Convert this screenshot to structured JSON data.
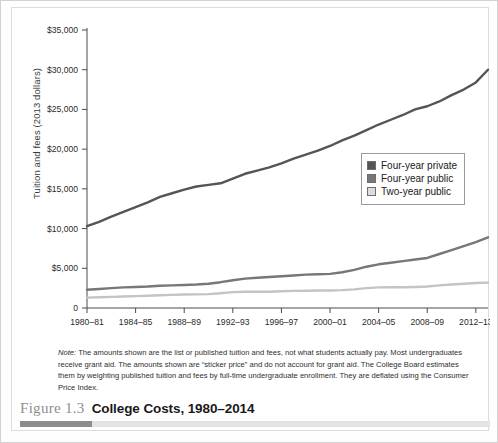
{
  "figure": {
    "number": "Figure 1.3",
    "title": "College Costs, 1980–2014"
  },
  "axes": {
    "ylabel": "Tuition and fees (2013 dollars)",
    "yticks": [
      "0",
      "$5,000",
      "$10,000",
      "$15,000",
      "$20,000",
      "$25,000",
      "$30,000",
      "$35,000"
    ],
    "xticks": [
      "1980–81",
      "1984–85",
      "1988–89",
      "1992–93",
      "1996–97",
      "2000–01",
      "2004–05",
      "2008–09",
      "2012–13"
    ]
  },
  "legend": {
    "items": [
      {
        "label": "Four-year private",
        "color": "#555555"
      },
      {
        "label": "Four-year public",
        "color": "#777777"
      },
      {
        "label": "Two-year public",
        "color": "#c4c4c4"
      }
    ]
  },
  "note": {
    "prefix": "Note:",
    "text": " The amounts shown are the list or published tuition and fees, not what students actually pay. Most undergraduates receive grant aid. The amounts shown are “sticker price” and do not account for grant aid. The College Board estimates them by weighting published tuition and fees by full-time undergraduate enrollment. They are deflated using the Consumer Price Index."
  },
  "chart_data": {
    "type": "line",
    "title": "College Costs, 1980–2014",
    "xlabel": "",
    "ylabel": "Tuition and fees (2013 dollars)",
    "ylim": [
      0,
      35000
    ],
    "grid": false,
    "legend_position": "right-middle",
    "x": [
      "1980–81",
      "1981–82",
      "1982–83",
      "1983–84",
      "1984–85",
      "1985–86",
      "1986–87",
      "1987–88",
      "1988–89",
      "1989–90",
      "1990–91",
      "1991–92",
      "1992–93",
      "1993–94",
      "1994–95",
      "1995–96",
      "1996–97",
      "1997–98",
      "1998–99",
      "1999–00",
      "2000–01",
      "2001–02",
      "2002–03",
      "2003–04",
      "2004–05",
      "2005–06",
      "2006–07",
      "2007–08",
      "2008–09",
      "2009–10",
      "2010–11",
      "2011–12",
      "2012–13",
      "2013–14"
    ],
    "series": [
      {
        "name": "Four-year private",
        "color": "#555555",
        "values": [
          10300,
          10850,
          11500,
          12100,
          12700,
          13300,
          14000,
          14450,
          14900,
          15300,
          15500,
          15700,
          16300,
          16900,
          17300,
          17700,
          18200,
          18800,
          19300,
          19800,
          20400,
          21100,
          21700,
          22400,
          23100,
          23700,
          24300,
          25000,
          25400,
          26000,
          26800,
          27500,
          28400,
          30000
        ]
      },
      {
        "name": "Four-year public",
        "color": "#777777",
        "values": [
          2300,
          2400,
          2500,
          2600,
          2650,
          2700,
          2800,
          2850,
          2900,
          2950,
          3050,
          3250,
          3500,
          3700,
          3800,
          3900,
          4000,
          4100,
          4200,
          4250,
          4300,
          4500,
          4800,
          5200,
          5500,
          5700,
          5900,
          6100,
          6300,
          6800,
          7300,
          7800,
          8300,
          8900
        ]
      },
      {
        "name": "Two-year public",
        "color": "#c4c4c4",
        "values": [
          1300,
          1350,
          1400,
          1450,
          1500,
          1550,
          1600,
          1650,
          1700,
          1720,
          1750,
          1850,
          2000,
          2050,
          2050,
          2050,
          2100,
          2150,
          2180,
          2200,
          2200,
          2250,
          2350,
          2500,
          2600,
          2620,
          2620,
          2650,
          2700,
          2850,
          2950,
          3050,
          3150,
          3200
        ]
      }
    ]
  }
}
